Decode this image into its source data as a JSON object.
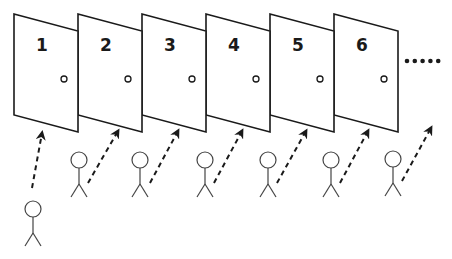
{
  "diagram": {
    "colors": {
      "stroke": "#1a1a1a",
      "background": "#ffffff",
      "figure": "#444444"
    },
    "doors": [
      {
        "label": "1",
        "x": 14
      },
      {
        "label": "2",
        "x": 78
      },
      {
        "label": "3",
        "x": 142
      },
      {
        "label": "4",
        "x": 206
      },
      {
        "label": "5",
        "x": 270
      },
      {
        "label": "6",
        "x": 334
      }
    ],
    "continuation": ".....",
    "people": [
      {
        "head_x": 33,
        "head_y": 209,
        "arrow_from": [
          32,
          188
        ],
        "arrow_to": [
          42,
          133
        ]
      },
      {
        "head_x": 79,
        "head_y": 160,
        "arrow_from": [
          88,
          183
        ],
        "arrow_to": [
          118,
          131
        ]
      },
      {
        "head_x": 140,
        "head_y": 160,
        "arrow_from": [
          150,
          183
        ],
        "arrow_to": [
          178,
          131
        ]
      },
      {
        "head_x": 205,
        "head_y": 160,
        "arrow_from": [
          214,
          183
        ],
        "arrow_to": [
          242,
          131
        ]
      },
      {
        "head_x": 268,
        "head_y": 160,
        "arrow_from": [
          277,
          183
        ],
        "arrow_to": [
          306,
          131
        ]
      },
      {
        "head_x": 331,
        "head_y": 160,
        "arrow_from": [
          340,
          183
        ],
        "arrow_to": [
          368,
          131
        ]
      },
      {
        "head_x": 393,
        "head_y": 159,
        "arrow_from": [
          402,
          181
        ],
        "arrow_to": [
          431,
          128
        ]
      }
    ]
  }
}
